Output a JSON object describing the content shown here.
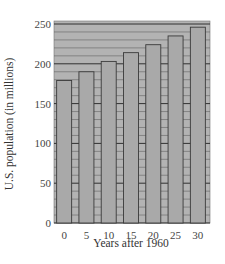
{
  "chart_data": {
    "type": "bar",
    "title": "",
    "xlabel": "Years after 1960",
    "ylabel": "U.S. population (in millions)",
    "categories": [
      "0",
      "5",
      "10",
      "15",
      "20",
      "25",
      "30"
    ],
    "values": [
      179,
      190,
      203,
      214,
      224,
      235,
      246
    ],
    "ylim": [
      0,
      250
    ],
    "yticks": [
      0,
      50,
      100,
      150,
      200,
      250
    ],
    "minor_grid_step": 10,
    "grid": true,
    "legend": null
  },
  "colors": {
    "plot_bg": "#b3b3b3",
    "bar_fill": "#a9a9a9",
    "bar_stroke": "#3a3a3a",
    "grid_minor": "#555555",
    "grid_major": "#222222"
  }
}
